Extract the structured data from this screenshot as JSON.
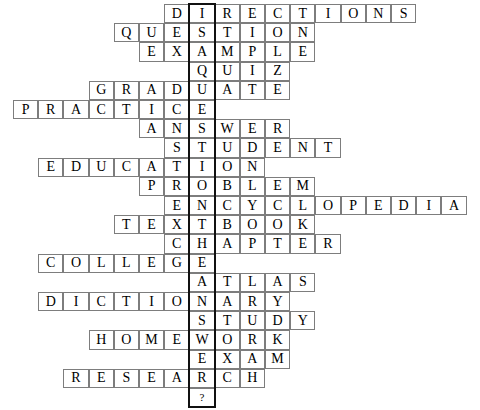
{
  "puzzle": {
    "title": "Education Crossword Grid",
    "type": "crossword-word-stack",
    "cell_width": 25.2,
    "cell_height": 19.2,
    "origin_x": 13,
    "origin_y": 4,
    "rows": 21,
    "columns": 19,
    "highlight_column_index": 7,
    "highlight_color": "#111111",
    "cell_border_color": "#7d7d7d",
    "cell_background": "#ffffff",
    "text_color": "#000000",
    "vertical_answer": "ISAQUESTIONTHEANSWER?",
    "vertical_answer_readable": "IS A QUESTION THE ANSWER?",
    "entries": [
      {
        "row": 0,
        "col": 6,
        "word": "DIRECTIONS"
      },
      {
        "row": 1,
        "col": 4,
        "word": "QUESTION"
      },
      {
        "row": 2,
        "col": 5,
        "word": "EXAMPLE"
      },
      {
        "row": 3,
        "col": 7,
        "word": "QUIZ"
      },
      {
        "row": 4,
        "col": 3,
        "word": "GRADUATE"
      },
      {
        "row": 5,
        "col": 0,
        "word": "PRACTICE"
      },
      {
        "row": 6,
        "col": 5,
        "word": "ANSWER"
      },
      {
        "row": 7,
        "col": 6,
        "word": "STUDENT"
      },
      {
        "row": 8,
        "col": 1,
        "word": "EDUCATION"
      },
      {
        "row": 9,
        "col": 5,
        "word": "PROBLEM"
      },
      {
        "row": 10,
        "col": 6,
        "word": "ENCYCLOPEDIA"
      },
      {
        "row": 11,
        "col": 4,
        "word": "TEXTBOOK"
      },
      {
        "row": 12,
        "col": 6,
        "word": "CHAPTER"
      },
      {
        "row": 13,
        "col": 1,
        "word": "COLLEGE"
      },
      {
        "row": 14,
        "col": 7,
        "word": "ATLAS"
      },
      {
        "row": 15,
        "col": 1,
        "word": "DICTIONARY"
      },
      {
        "row": 16,
        "col": 7,
        "word": "STUDY"
      },
      {
        "row": 17,
        "col": 3,
        "word": "HOMEWORK"
      },
      {
        "row": 18,
        "col": 7,
        "word": "EXAM"
      },
      {
        "row": 19,
        "col": 2,
        "word": "RESEARCH"
      },
      {
        "row": 20,
        "col": 7,
        "word": "?"
      }
    ]
  }
}
